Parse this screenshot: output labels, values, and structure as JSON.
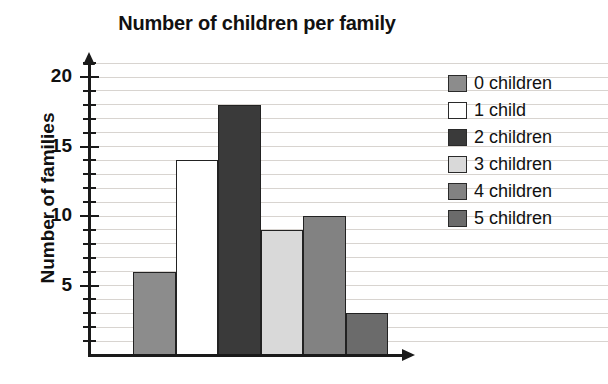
{
  "chart_data": {
    "type": "bar",
    "title": "Number of children per family",
    "xlabel": "",
    "ylabel": "Number of families",
    "categories": [
      "0 children",
      "1 child",
      "2 children",
      "3 children",
      "4 children",
      "5 children"
    ],
    "values": [
      6,
      14,
      18,
      9,
      10,
      3
    ],
    "ylim": [
      0,
      21
    ],
    "y_major_ticks": [
      5,
      10,
      15,
      20
    ],
    "y_major_tick_labels": [
      "5",
      "10",
      "15",
      "20"
    ],
    "y_minor_tick_step": 1,
    "grid": true,
    "grid_orientation": "horizontal",
    "legend_position": "right",
    "legend": [
      {
        "label": "0 children",
        "color": "#8c8c8c",
        "value": 6
      },
      {
        "label": "1 child",
        "color": "#ffffff",
        "value": 14
      },
      {
        "label": "2 children",
        "color": "#3a3a3a",
        "value": 18
      },
      {
        "label": "3 children",
        "color": "#d9d9d9",
        "value": 9
      },
      {
        "label": "4 children",
        "color": "#828282",
        "value": 10
      },
      {
        "label": "5 children",
        "color": "#6b6b6b",
        "value": 3
      }
    ],
    "axis_color": "#1a1a1a",
    "gridline_color": "#d8d4d0",
    "background": "#ffffff"
  }
}
